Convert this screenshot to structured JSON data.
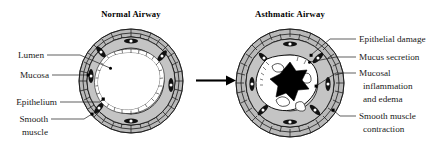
{
  "figure": {
    "background_color": "#ffffff",
    "width": 442,
    "height": 147
  },
  "panels": {
    "normal": {
      "title": "Normal Airway",
      "lumen_state": "open",
      "wall_state": "thin"
    },
    "asthmatic": {
      "title": "Asthmatic Airway",
      "lumen_state": "narrowed",
      "wall_state": "thickened"
    }
  },
  "arrow": {
    "name": "progression-arrow",
    "direction": "right"
  },
  "left_labels": [
    {
      "id": "lumen",
      "text": "Lumen"
    },
    {
      "id": "mucosa",
      "text": "Mucosa"
    },
    {
      "id": "epithelium",
      "text": "Epithelium"
    },
    {
      "id": "smooth-muscle-line1",
      "text": "Smooth"
    },
    {
      "id": "smooth-muscle-line2",
      "text": "muscle"
    }
  ],
  "right_labels": [
    {
      "id": "epithelial-damage",
      "text": "Epithelial damage"
    },
    {
      "id": "mucus-secretion",
      "text": "Mucus secretion"
    },
    {
      "id": "mucosal-inflammation-line1",
      "text": "Mucosal"
    },
    {
      "id": "mucosal-inflammation-line2",
      "text": "inflammation"
    },
    {
      "id": "mucosal-inflammation-line3",
      "text": "and edema"
    },
    {
      "id": "smooth-muscle-contraction-line1",
      "text": "Smooth muscle"
    },
    {
      "id": "smooth-muscle-contraction-line2",
      "text": "contraction"
    }
  ],
  "colors": {
    "ink": "#111111",
    "smooth_muscle_gray": "#b9b9b9",
    "mucosa_gray": "#c4c4c4",
    "epithelium_white": "#ffffff",
    "occlusion_black": "#000000",
    "background": "#ffffff"
  }
}
